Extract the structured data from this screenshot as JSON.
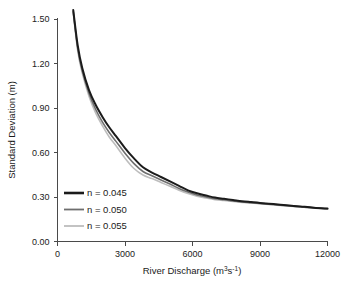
{
  "chart_data": {
    "type": "line",
    "title": "",
    "xlabel": "River Discharge (m3s-1)",
    "xlabel_base": "River Discharge (m",
    "xlabel_sup1": "3",
    "xlabel_mid": "s",
    "xlabel_sup2": "-1",
    "xlabel_close": ")",
    "ylabel": "Standard Deviation (m)",
    "xlim": [
      0,
      12000
    ],
    "ylim": [
      0.0,
      1.5
    ],
    "grid": false,
    "legend_position": "lower left",
    "xticks": [
      0,
      3000,
      6000,
      9000,
      12000
    ],
    "xtick_labels": [
      "0",
      "3000",
      "6000",
      "9000",
      "12000"
    ],
    "yticks": [
      0.0,
      0.3,
      0.6,
      0.9,
      1.2,
      1.5
    ],
    "ytick_labels": [
      "0.00",
      "0.30",
      "0.60",
      "0.90",
      "1.20",
      "1.50"
    ],
    "x": [
      700,
      900,
      1100,
      1400,
      1700,
      2000,
      2300,
      2600,
      3000,
      3400,
      3800,
      4200,
      4600,
      5000,
      5400,
      5800,
      6200,
      6600,
      7000,
      7400,
      7800,
      8200,
      8600,
      9000,
      9600,
      10200,
      10800,
      11400,
      12000
    ],
    "series": [
      {
        "name": "n = 0.045",
        "color": "#1b1b1b",
        "width": 2.0,
        "values": [
          1.56,
          1.32,
          1.17,
          1.02,
          0.92,
          0.84,
          0.77,
          0.71,
          0.63,
          0.56,
          0.5,
          0.465,
          0.435,
          0.405,
          0.375,
          0.345,
          0.325,
          0.31,
          0.296,
          0.288,
          0.28,
          0.272,
          0.266,
          0.26,
          0.252,
          0.244,
          0.236,
          0.228,
          0.222
        ]
      },
      {
        "name": "n = 0.050",
        "color": "#6e6e6e",
        "width": 1.6,
        "values": [
          1.55,
          1.3,
          1.15,
          1.0,
          0.89,
          0.805,
          0.735,
          0.675,
          0.595,
          0.525,
          0.472,
          0.443,
          0.415,
          0.387,
          0.358,
          0.333,
          0.314,
          0.3,
          0.288,
          0.281,
          0.274,
          0.267,
          0.262,
          0.257,
          0.249,
          0.241,
          0.234,
          0.227,
          0.221
        ]
      },
      {
        "name": "n = 0.055",
        "color": "#bdbdbd",
        "width": 1.6,
        "values": [
          1.545,
          1.285,
          1.135,
          0.98,
          0.865,
          0.78,
          0.705,
          0.645,
          0.562,
          0.492,
          0.448,
          0.424,
          0.398,
          0.372,
          0.346,
          0.323,
          0.306,
          0.293,
          0.282,
          0.276,
          0.27,
          0.264,
          0.259,
          0.254,
          0.247,
          0.24,
          0.233,
          0.226,
          0.22
        ]
      }
    ],
    "legend_entries": [
      {
        "label": "n = 0.045",
        "color": "#1b1b1b"
      },
      {
        "label": "n = 0.050",
        "color": "#6e6e6e"
      },
      {
        "label": "n = 0.055",
        "color": "#bdbdbd"
      }
    ]
  }
}
